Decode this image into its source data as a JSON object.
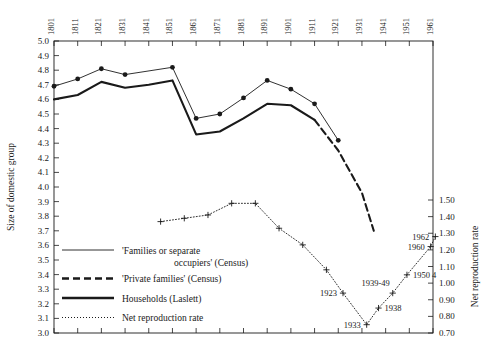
{
  "chart_data": {
    "type": "line",
    "title": "",
    "xlabel": "",
    "ylabel": "Size of domestic group",
    "y2label": "Net reproduction rate",
    "grid": false,
    "legend_position": "inside-lower-left",
    "x": [
      1801,
      1811,
      1821,
      1831,
      1841,
      1851,
      1861,
      1871,
      1881,
      1891,
      1901,
      1911,
      1921,
      1931,
      1941,
      1951,
      1961
    ],
    "xtick_labels": [
      "1801",
      "1811",
      "1821",
      "1831",
      "1841",
      "1851",
      "1861",
      "1871",
      "1881",
      "1891",
      "1901",
      "1911",
      "1921",
      "1931",
      "1941",
      "1951",
      "1961"
    ],
    "ylim": [
      3.0,
      5.0
    ],
    "ytick_labels": [
      "5.0",
      "4.9",
      "4.8",
      "4.7",
      "4.6",
      "4.5",
      "4.4",
      "4.3",
      "4.2",
      "4.1",
      "4.0",
      "3.9",
      "3.8",
      "3.7",
      "3.6",
      "3.5",
      "3.4",
      "3.3",
      "3.2",
      "3.1",
      "3.0"
    ],
    "ytick_values": [
      5.0,
      4.9,
      4.8,
      4.7,
      4.6,
      4.5,
      4.4,
      4.3,
      4.2,
      4.1,
      4.0,
      3.9,
      3.8,
      3.7,
      3.6,
      3.5,
      3.4,
      3.3,
      3.2,
      3.1,
      3.0
    ],
    "y2lim": [
      0.7,
      1.5
    ],
    "y2tick_labels": [
      "1.50",
      "1.40",
      "1.30",
      "1.20",
      "1.10",
      "1.00",
      "0.90",
      "0.80",
      "0.70"
    ],
    "y2tick_values": [
      1.5,
      1.4,
      1.3,
      1.2,
      1.1,
      1.0,
      0.9,
      0.8,
      0.7
    ],
    "series": [
      {
        "name": "'Families or separate occupiers' (Census)",
        "style": "solid-thin-markers",
        "axis": "left",
        "points": [
          {
            "x": 1801,
            "y": 4.69
          },
          {
            "x": 1811,
            "y": 4.74
          },
          {
            "x": 1821,
            "y": 4.81
          },
          {
            "x": 1831,
            "y": 4.77
          },
          {
            "x": 1851,
            "y": 4.82
          },
          {
            "x": 1861,
            "y": 4.47
          },
          {
            "x": 1871,
            "y": 4.5
          },
          {
            "x": 1881,
            "y": 4.61
          },
          {
            "x": 1891,
            "y": 4.73
          },
          {
            "x": 1901,
            "y": 4.67
          },
          {
            "x": 1911,
            "y": 4.57
          },
          {
            "x": 1921,
            "y": 4.32
          }
        ]
      },
      {
        "name": "'Private families' (Census)",
        "style": "dashed-thick",
        "axis": "left",
        "points": [
          {
            "x": 1911,
            "y": 4.46
          },
          {
            "x": 1921,
            "y": 4.25
          },
          {
            "x": 1931,
            "y": 3.96
          },
          {
            "x": 1936,
            "y": 3.7
          }
        ]
      },
      {
        "name": "Households (Laslett)",
        "style": "solid-thick",
        "axis": "left",
        "points": [
          {
            "x": 1801,
            "y": 4.6
          },
          {
            "x": 1811,
            "y": 4.63
          },
          {
            "x": 1821,
            "y": 4.72
          },
          {
            "x": 1831,
            "y": 4.68
          },
          {
            "x": 1841,
            "y": 4.7
          },
          {
            "x": 1851,
            "y": 4.73
          },
          {
            "x": 1861,
            "y": 4.36
          },
          {
            "x": 1871,
            "y": 4.38
          },
          {
            "x": 1881,
            "y": 4.47
          },
          {
            "x": 1891,
            "y": 4.57
          },
          {
            "x": 1901,
            "y": 4.56
          },
          {
            "x": 1911,
            "y": 4.46
          }
        ]
      },
      {
        "name": "Net reproduction rate",
        "style": "dotted-plus-markers",
        "axis": "right",
        "points": [
          {
            "x": 1846,
            "y": 1.37
          },
          {
            "x": 1856,
            "y": 1.39
          },
          {
            "x": 1866,
            "y": 1.41
          },
          {
            "x": 1876,
            "y": 1.48
          },
          {
            "x": 1886,
            "y": 1.48
          },
          {
            "x": 1896,
            "y": 1.33
          },
          {
            "x": 1906,
            "y": 1.23
          },
          {
            "x": 1916,
            "y": 1.08
          },
          {
            "x": 1923,
            "y": 0.94
          },
          {
            "x": 1933,
            "y": 0.75
          },
          {
            "x": 1938,
            "y": 0.85
          },
          {
            "x": 1944,
            "y": 0.94
          },
          {
            "x": 1950,
            "y": 1.05
          },
          {
            "x": 1960,
            "y": 1.22
          },
          {
            "x": 1962,
            "y": 1.28
          }
        ]
      }
    ],
    "annotations": [
      {
        "text": "1923",
        "x": 1923,
        "y": 0.94,
        "placement": "left"
      },
      {
        "text": "1933",
        "x": 1933,
        "y": 0.75,
        "placement": "left"
      },
      {
        "text": "1938",
        "x": 1938,
        "y": 0.85,
        "placement": "right"
      },
      {
        "text": "1939-49",
        "x": 1944,
        "y": 0.94,
        "placement": "above-left"
      },
      {
        "text": "1950 4",
        "x": 1950,
        "y": 1.05,
        "placement": "right"
      },
      {
        "text": "1960",
        "x": 1960,
        "y": 1.22,
        "placement": "left"
      },
      {
        "text": "1962",
        "x": 1962,
        "y": 1.28,
        "placement": "left"
      }
    ],
    "legend": [
      {
        "label_line1": "'Families or separate",
        "label_line2": "occupiers' (Census)",
        "style": "solid-thin"
      },
      {
        "label_line1": "'Private families' (Census)",
        "label_line2": "",
        "style": "dashed-thick"
      },
      {
        "label_line1": "Households (Laslett)",
        "label_line2": "",
        "style": "solid-thick"
      },
      {
        "label_line1": "Net reproduction rate",
        "label_line2": "",
        "style": "dotted"
      }
    ],
    "colors": {
      "ink": "#1a1a1a",
      "background": "#ffffff"
    }
  }
}
